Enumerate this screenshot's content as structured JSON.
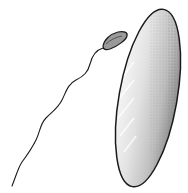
{
  "illustration": {
    "subject": "bacterium-with-flagellum",
    "colors": {
      "background": "#ffffff",
      "outline": "#1a1a1a",
      "body_fill": "#d9d9d9",
      "highlight": "#f2f2f2",
      "shade": "#8a8a8a"
    }
  }
}
